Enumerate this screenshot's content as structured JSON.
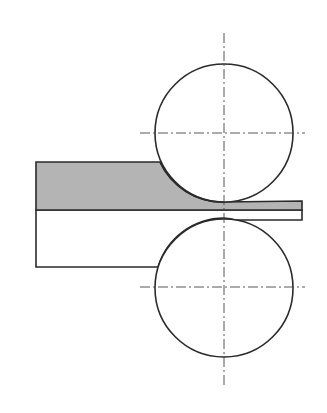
{
  "diagram": {
    "elements": [
      {
        "name": "upper-roll",
        "kind": "circle"
      },
      {
        "name": "lower-roll",
        "kind": "circle"
      },
      {
        "name": "workpiece-deformed-layer",
        "kind": "shaded region"
      },
      {
        "name": "workpiece-base-layer",
        "kind": "unshaded region"
      },
      {
        "name": "centerlines",
        "kind": "dash-dot lines"
      }
    ],
    "colors": {
      "stroke": "#2a2a2a",
      "fill_shaded": "#b4b4b4",
      "background": "#ffffff",
      "centerline": "#444444"
    }
  }
}
